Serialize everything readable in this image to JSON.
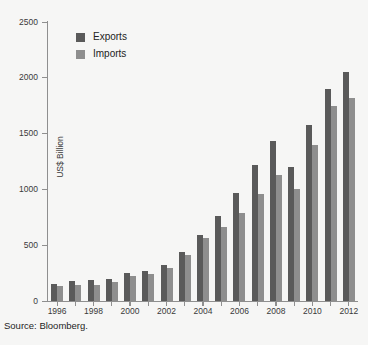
{
  "source_note": "Source: Bloomberg.",
  "legend": {
    "position": "top-left-inside",
    "entries": [
      {
        "label": "Exports",
        "color": "#5a5a5a"
      },
      {
        "label": "Imports",
        "color": "#8e8e8e"
      }
    ]
  },
  "chart_data": {
    "type": "bar",
    "title": "",
    "xlabel": "",
    "ylabel": "US$ Billion",
    "ylim": [
      0,
      2500
    ],
    "yticks": [
      0,
      500,
      1000,
      1500,
      2000,
      2500
    ],
    "ytick_labels": [
      "0",
      "500",
      "1000",
      "1500",
      "2000",
      "2500"
    ],
    "grid": false,
    "categories": [
      "1996",
      "1997",
      "1998",
      "1999",
      "2000",
      "2001",
      "2002",
      "2003",
      "2004",
      "2005",
      "2006",
      "2007",
      "2008",
      "2009",
      "2010",
      "2011",
      "2012"
    ],
    "xtick_labels": [
      "1996",
      "1998",
      "2000",
      "2002",
      "2004",
      "2006",
      "2008",
      "2010",
      "2012"
    ],
    "series": [
      {
        "name": "Exports",
        "color": "#5a5a5a",
        "values": [
          151,
          183,
          184,
          195,
          249,
          266,
          326,
          438,
          593,
          762,
          969,
          1220,
          1430,
          1202,
          1578,
          1898,
          2049
        ]
      },
      {
        "name": "Imports",
        "color": "#8e8e8e",
        "values": [
          139,
          142,
          140,
          166,
          225,
          244,
          295,
          413,
          561,
          660,
          792,
          956,
          1133,
          1006,
          1396,
          1743,
          1818
        ]
      }
    ]
  }
}
